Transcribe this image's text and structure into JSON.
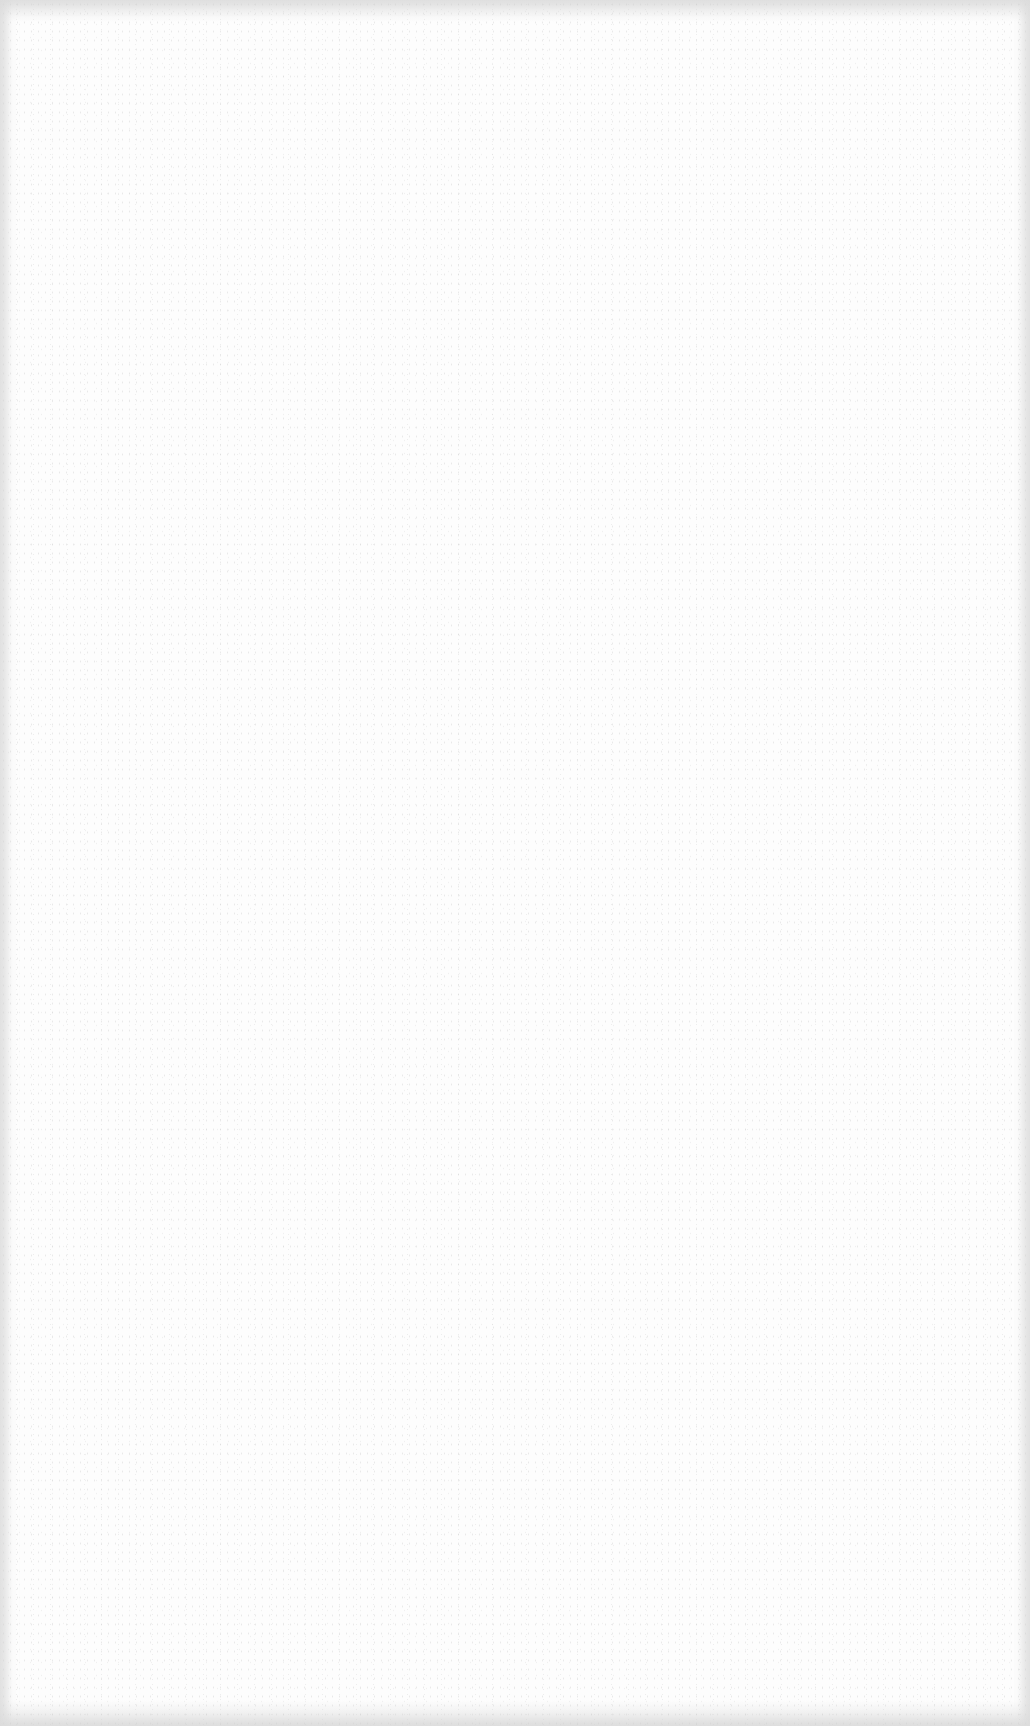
{
  "page": {
    "content": "",
    "background_color": "#fdfdfd",
    "edge_shade_color": "#d7d7d7",
    "noise_color": "#969696"
  }
}
